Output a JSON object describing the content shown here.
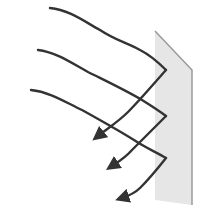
{
  "diagram": {
    "colors": {
      "ray": "#333333",
      "surface_fill": "#e6e6e6",
      "surface_edge": "#9a9a9a",
      "background": "#ffffff"
    },
    "surface": {
      "points": [
        [
          155,
          31
        ],
        [
          192,
          70
        ],
        [
          192,
          205
        ],
        [
          155,
          200
        ]
      ]
    },
    "rays": [
      {
        "incident": "M50,8 C70,10 85,22 100,30 C115,40 125,42 140,50 C150,55 158,62 166,70",
        "reflected": "M166,70 C150,88 140,100 128,112 C118,122 108,128 98,136",
        "arrow_tip": [
          96,
          137
        ]
      },
      {
        "incident": "M38,50 C55,52 70,62 88,72 C108,82 125,90 142,100 C150,105 158,110 166,116",
        "reflected": "M166,116 C152,130 142,140 132,150 C125,158 118,162 112,166",
        "arrow_tip": [
          110,
          168
        ]
      },
      {
        "incident": "M31,90 C50,92 65,102 82,110 C100,120 118,130 134,140 C146,148 156,152 166,158",
        "reflected": "M166,158 C155,172 148,180 140,188 C134,194 128,196 122,198",
        "arrow_tip": [
          122,
          200
        ]
      }
    ]
  }
}
